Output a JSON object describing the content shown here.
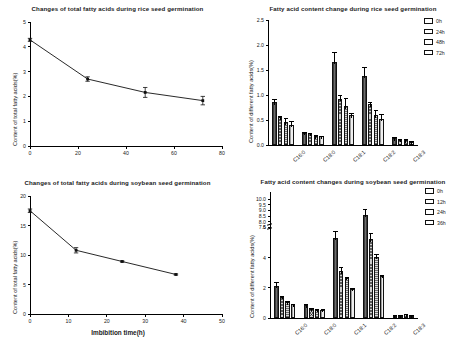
{
  "figure": {
    "panels": [
      "rice-total-line",
      "rice-fatty-acid-bars",
      "soybean-total-line",
      "soybean-fatty-acid-bars"
    ]
  },
  "chart_data": [
    {
      "id": "rice-total-line",
      "type": "line",
      "title": "Changes of total fatty acids during rice seed germination",
      "xlabel": "",
      "ylabel": "Content of total fatty acids(%)",
      "xlim": [
        0,
        80
      ],
      "ylim": [
        0,
        5
      ],
      "xticks": [
        0,
        20,
        40,
        60,
        80
      ],
      "yticks": [
        0,
        1,
        2,
        3,
        4,
        5
      ],
      "grid": false,
      "x": [
        0,
        24,
        48,
        72
      ],
      "y": [
        4.28,
        2.7,
        2.16,
        1.83
      ],
      "yerr": [
        0.06,
        0.09,
        0.2,
        0.17
      ],
      "marker": "square",
      "legend": "none"
    },
    {
      "id": "rice-fatty-acid-bars",
      "type": "bar",
      "title": "Fatty acid content change during rice seed germination",
      "xlabel": "",
      "ylabel": "Content of different fatty acids(%)",
      "ylim": [
        0,
        2.5
      ],
      "yticks": [
        0.0,
        0.5,
        1.0,
        1.5,
        2.0,
        2.5
      ],
      "ytick_labels": [
        "0.0",
        "0.5",
        "1.0",
        "1.5",
        "2.0",
        "2.5"
      ],
      "categories": [
        "C16:0",
        "C18:0",
        "C18:1",
        "C18:2",
        "C18:3"
      ],
      "grid": false,
      "legend_position": "top-right",
      "series": [
        {
          "name": "0h",
          "values": [
            0.86,
            0.25,
            1.67,
            1.39,
            0.14
          ],
          "errors": [
            0.07,
            0.01,
            0.2,
            0.17,
            0.02
          ]
        },
        {
          "name": "24h",
          "values": [
            0.56,
            0.24,
            0.93,
            0.82,
            0.11
          ],
          "errors": [
            0.03,
            0.01,
            0.07,
            0.05,
            0.02
          ]
        },
        {
          "name": "48h",
          "values": [
            0.46,
            0.18,
            0.78,
            0.6,
            0.1
          ],
          "errors": [
            0.09,
            0.02,
            0.16,
            0.11,
            0.02
          ]
        },
        {
          "name": "72h",
          "values": [
            0.41,
            0.18,
            0.6,
            0.53,
            0.06
          ],
          "errors": [
            0.07,
            0.01,
            0.04,
            0.1,
            0.02
          ]
        }
      ]
    },
    {
      "id": "soybean-total-line",
      "type": "line",
      "title": "Changes of total fatty acids during soybean seed germination",
      "xlabel": "Imbibition  time(h)",
      "ylabel": "Content of total fatty acids(%)",
      "xlim": [
        0,
        50
      ],
      "ylim": [
        0,
        20
      ],
      "xticks": [
        0,
        10,
        20,
        30,
        40,
        50
      ],
      "yticks": [
        0,
        5,
        10,
        15,
        20
      ],
      "grid": false,
      "x": [
        0,
        12,
        24,
        38
      ],
      "y": [
        17.5,
        10.8,
        8.9,
        6.7
      ],
      "yerr": [
        0.3,
        0.45,
        0.1,
        0.1
      ],
      "marker": "square",
      "legend": "none"
    },
    {
      "id": "soybean-fatty-acid-bars",
      "type": "bar",
      "title": "Fatty acid content changes during soybean seed germination",
      "xlabel": "",
      "ylabel": "Content of different fatty acids(%)",
      "ylim": [
        0,
        10
      ],
      "yticks": [
        0,
        2,
        4,
        6,
        7.5,
        8.0,
        8.5,
        9.0,
        9.5,
        10.0
      ],
      "ytick_labels": [
        "0",
        "2",
        "4",
        "6",
        "7.5",
        "8.0",
        "8.5",
        "9.0",
        "9.5",
        "10.0"
      ],
      "axis_break": {
        "below": 6,
        "above": 7.5
      },
      "categories": [
        "C16:0",
        "C18:0",
        "C18:1",
        "C18:2",
        "C18:3"
      ],
      "grid": false,
      "legend_position": "top-right",
      "series": [
        {
          "name": "0h",
          "values": [
            2.15,
            0.85,
            5.3,
            8.6,
            0.15
          ],
          "errors": [
            0.25,
            0.07,
            0.45,
            0.55,
            0.03
          ]
        },
        {
          "name": "12h",
          "values": [
            1.4,
            0.6,
            3.1,
            5.2,
            0.16
          ],
          "errors": [
            0.07,
            0.05,
            0.25,
            0.45,
            0.03
          ]
        },
        {
          "name": "24h",
          "values": [
            1.05,
            0.55,
            2.65,
            4.05,
            0.25
          ],
          "errors": [
            0.06,
            0.06,
            0.08,
            0.2,
            0.04
          ]
        },
        {
          "name": "36h",
          "values": [
            0.9,
            0.55,
            1.95,
            2.8,
            0.15
          ],
          "errors": [
            0.05,
            0.05,
            0.04,
            0.03,
            0.03
          ]
        }
      ]
    }
  ]
}
